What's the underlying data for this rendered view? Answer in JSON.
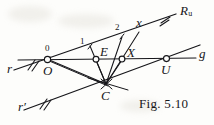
{
  "figure": {
    "caption": "Fig. 5.10",
    "ink_color": "#16161a",
    "paper_color": "#fdfdfb",
    "width": 214,
    "height": 125,
    "labels": {
      "ray_upper": "R",
      "ray_upper_sub": "u",
      "line_g": "g",
      "line_r": "r",
      "line_r_prime": "r′",
      "tick_zero": "0",
      "tick_one": "1",
      "tick_two": "2",
      "tick_x": "x",
      "point_O": "O",
      "point_E": "E",
      "point_X": "X",
      "point_U": "U",
      "point_C": "C"
    },
    "points": [
      {
        "name": "O",
        "label": "O",
        "x": 48,
        "y": 59,
        "marker": "circle"
      },
      {
        "name": "E",
        "label": "E",
        "x": 96,
        "y": 59,
        "marker": "circle"
      },
      {
        "name": "X",
        "label": "X",
        "x": 122,
        "y": 59,
        "marker": "circle"
      },
      {
        "name": "U",
        "label": "U",
        "x": 167,
        "y": 59,
        "marker": "circle"
      },
      {
        "name": "C",
        "label": "C",
        "x": 106,
        "y": 84,
        "marker": "cross"
      },
      {
        "name": "t1",
        "label": "1",
        "x": 90,
        "y": 43,
        "marker": "none"
      },
      {
        "name": "t2",
        "label": "2",
        "x": 124,
        "y": 31,
        "marker": "none"
      },
      {
        "name": "tx",
        "label": "x",
        "x": 140,
        "y": 26,
        "marker": "none"
      }
    ],
    "lines": [
      {
        "name": "ray-Ru",
        "from": "r",
        "to": "R_u",
        "style": "solid"
      },
      {
        "name": "line-g",
        "from": "O",
        "to": "g",
        "style": "solid"
      },
      {
        "name": "line-r-prime",
        "from": "r-prime",
        "to": "U",
        "style": "solid"
      },
      {
        "name": "pencil-C-1",
        "from": "C",
        "to": "1",
        "style": "solid"
      },
      {
        "name": "pencil-C-2",
        "from": "C",
        "to": "2",
        "style": "solid"
      },
      {
        "name": "pencil-C-x",
        "from": "C",
        "to": "x",
        "style": "solid"
      },
      {
        "name": "pencil-C-O",
        "from": "C",
        "to": "O",
        "style": "solid"
      }
    ],
    "hatch_marks": [
      {
        "name": "hatch-r",
        "count": 2
      },
      {
        "name": "hatch-r-prime",
        "count": 2
      },
      {
        "name": "hatch-Ru",
        "count": 2
      }
    ]
  }
}
